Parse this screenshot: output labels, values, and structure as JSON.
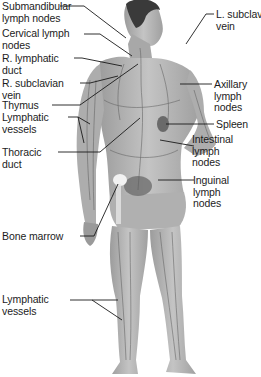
{
  "diagram": {
    "figure_colors": {
      "skin": "#b8b8b8",
      "skin_dark": "#8a8a8a",
      "hair": "#3a3a3a",
      "vessel": "#5a5a5a",
      "leader_line": "#1a1a1a",
      "bone_marrow": "#f2f2f2"
    },
    "labels_left": [
      {
        "id": "submandibular",
        "text": "Submandibular\nlymph nodes"
      },
      {
        "id": "cervical",
        "text": "Cervical lymph\nnodes"
      },
      {
        "id": "r-lymphatic-duct",
        "text": "R. lymphatic\nduct"
      },
      {
        "id": "r-subclavian",
        "text": "R. subclavian\nvein"
      },
      {
        "id": "thymus",
        "text": "Thymus"
      },
      {
        "id": "lymphatic-vessels-arm",
        "text": "Lymphatic\nvessels"
      },
      {
        "id": "thoracic-duct",
        "text": "Thoracic\nduct"
      },
      {
        "id": "bone-marrow",
        "text": "Bone marrow"
      },
      {
        "id": "lymphatic-vessels-leg",
        "text": "Lymphatic\nvessels"
      }
    ],
    "labels_right": [
      {
        "id": "l-subclavian",
        "text": "L. subclavian\nvein"
      },
      {
        "id": "axillary",
        "text": "Axillary\nlymph\nnodes"
      },
      {
        "id": "spleen",
        "text": "Spleen"
      },
      {
        "id": "intestinal",
        "text": "Intestinal\nlymph\nnodes"
      },
      {
        "id": "inguinal",
        "text": "Inguinal\nlymph\nnodes"
      }
    ]
  }
}
